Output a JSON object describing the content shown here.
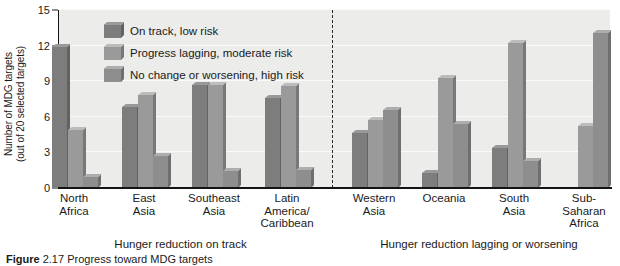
{
  "chart_data": {
    "type": "bar",
    "title": "",
    "xlabel": "",
    "ylabel_line1": "Number of MDG targets",
    "ylabel_line2": "(out of 20 selected targets)",
    "ylim": [
      0,
      15
    ],
    "yticks": [
      0,
      3,
      6,
      9,
      12,
      15
    ],
    "grid": true,
    "legend_position": "top-left-inside",
    "categories": [
      "North Africa",
      "East Asia",
      "Southeast Asia",
      "Latin America/ Caribbean",
      "Western Asia",
      "Oceania",
      "South Asia",
      "Sub-Saharan Africa"
    ],
    "category_lines": [
      [
        "North",
        "Africa"
      ],
      [
        "East",
        "Asia"
      ],
      [
        "Southeast",
        "Asia"
      ],
      [
        "Latin",
        "America/",
        "Caribbean"
      ],
      [
        "Western",
        "Asia"
      ],
      [
        "Oceania"
      ],
      [
        "South",
        "Asia"
      ],
      [
        "Sub-",
        "Saharan",
        "Africa"
      ]
    ],
    "series": [
      {
        "name": "On track, low risk",
        "color": "#7d7d7d",
        "values": [
          11.9,
          6.8,
          8.7,
          7.6,
          4.6,
          1.3,
          3.4,
          0
        ]
      },
      {
        "name": "Progress lagging, moderate risk",
        "color": "#9a9a9a",
        "values": [
          4.9,
          7.8,
          8.7,
          8.6,
          5.7,
          9.3,
          12.2,
          5.2
        ]
      },
      {
        "name": "No change or worsening, high risk",
        "color": "#8e8e8e",
        "values": [
          0.9,
          2.7,
          1.4,
          1.5,
          6.6,
          5.4,
          2.3,
          13.1
        ]
      }
    ],
    "annotations": [
      {
        "text": "Hunger reduction on track",
        "group_span": [
          0,
          3
        ]
      },
      {
        "text": "Hunger reduction lagging or worsening",
        "group_span": [
          4,
          7
        ]
      }
    ],
    "divider": {
      "style": "dashed",
      "after_category_index": 3
    }
  },
  "figure": {
    "caption_bold": "Figure",
    "caption_rest": "2.17 Progress toward MDG targets",
    "plot_background": "#ececeb",
    "axis_color": "#141414"
  }
}
